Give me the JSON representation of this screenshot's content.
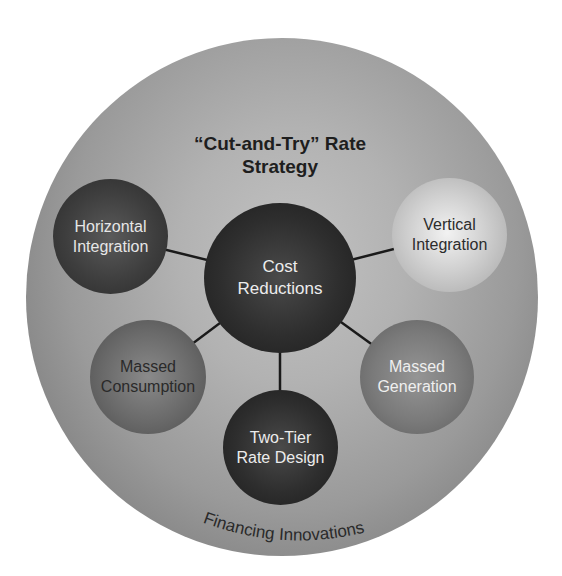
{
  "diagram": {
    "title": "“Cut-and-Try” Rate\nStrategy",
    "outer_ring_label": "Financing Innovations",
    "center_node": {
      "label": "Cost\nReductions"
    },
    "satellite_nodes": [
      {
        "id": "horizontal-integration",
        "label": "Horizontal\nIntegration"
      },
      {
        "id": "vertical-integration",
        "label": "Vertical\nIntegration"
      },
      {
        "id": "massed-consumption",
        "label": "Massed\nConsumption"
      },
      {
        "id": "massed-generation",
        "label": "Massed\nGeneration"
      },
      {
        "id": "two-tier-rate-design",
        "label": "Two-Tier\nRate Design"
      }
    ],
    "connections": [
      [
        "Cost Reductions",
        "Horizontal Integration"
      ],
      [
        "Cost Reductions",
        "Vertical Integration"
      ],
      [
        "Cost Reductions",
        "Massed Consumption"
      ],
      [
        "Cost Reductions",
        "Massed Generation"
      ],
      [
        "Cost Reductions",
        "Two-Tier Rate Design"
      ]
    ],
    "colors": {
      "background": "#ffffff",
      "outer_disc_center": "#c2c2c2",
      "outer_disc_edge": "#747474",
      "connector": "#1a1a1a"
    }
  }
}
